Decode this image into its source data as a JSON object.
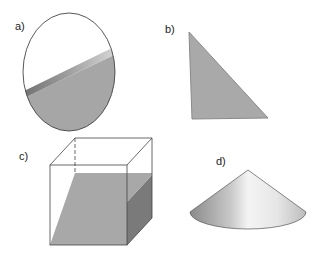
{
  "figures": [
    {
      "id": "a",
      "label": "a)",
      "shape": "ellipse-cross-section"
    },
    {
      "id": "b",
      "label": "b)",
      "shape": "triangle-cross-section"
    },
    {
      "id": "c",
      "label": "c)",
      "shape": "cube-with-slanted-fill"
    },
    {
      "id": "d",
      "label": "d)",
      "shape": "cone"
    }
  ],
  "colors": {
    "fill_gray": "#a8a8a8",
    "dark_gray": "#7a7a7a",
    "outline": "#444444",
    "background": "#ffffff"
  }
}
